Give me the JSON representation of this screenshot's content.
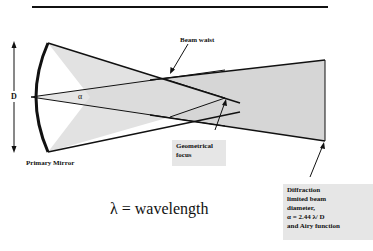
{
  "diagram": {
    "labels": {
      "beam_waist": "Beam waist",
      "aperture": "D",
      "angle": "α",
      "primary_mirror": "Primary Mirror",
      "geometrical_focus": [
        "Geometrical",
        "focus"
      ],
      "diffraction_note": [
        "Diffraction",
        "limited beam",
        "diameter,",
        "α  = 2.44    λ/ D",
        "and Airy function"
      ],
      "wavelength_legend": "λ = wavelength"
    },
    "colors": {
      "line": "#111111",
      "beam_fill": "#d6d6d6",
      "beam_fill_light": "#e4e4e4",
      "label_box": "#e6e6e6"
    }
  }
}
